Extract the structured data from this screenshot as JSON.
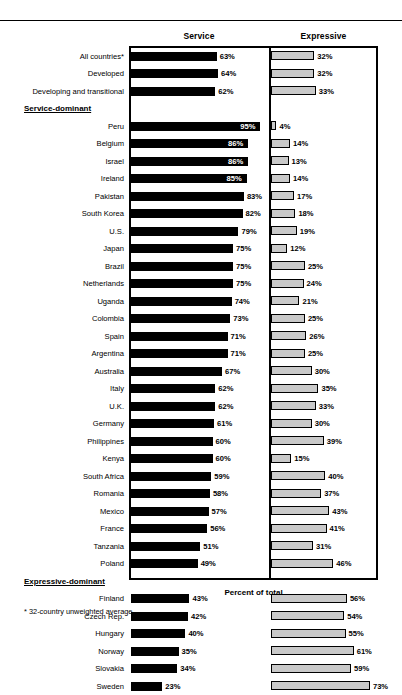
{
  "chart_data": {
    "type": "bar",
    "title": "",
    "xlabel": "Percent of total",
    "ylabel": "",
    "orientation": "horizontal",
    "grid": false,
    "legend_position": "top-column-headers",
    "panels": [
      {
        "name": "Service",
        "header": "Service",
        "xlim": [
          0,
          100
        ],
        "bar_style": "solid-black"
      },
      {
        "name": "Expressive",
        "header": "Expressive",
        "xlim": [
          0,
          75
        ],
        "bar_style": "gray-outlined"
      }
    ],
    "categories": [
      "All countries*",
      "Developed",
      "Developing and transitional",
      "Peru",
      "Belgium",
      "Israel",
      "Ireland",
      "Pakistan",
      "South Korea",
      "U.S.",
      "Japan",
      "Brazil",
      "Netherlands",
      "Uganda",
      "Colombia",
      "Spain",
      "Argentina",
      "Australia",
      "Italy",
      "U.K.",
      "Germany",
      "Philippines",
      "Kenya",
      "South Africa",
      "Romania",
      "Mexico",
      "France",
      "Tanzania",
      "Poland",
      "Finland",
      "Czech Rep.",
      "Hungary",
      "Norway",
      "Slovakia",
      "Sweden"
    ],
    "series": [
      {
        "name": "Service",
        "values": [
          63,
          64,
          62,
          95,
          86,
          86,
          85,
          83,
          82,
          79,
          75,
          75,
          75,
          74,
          73,
          71,
          71,
          67,
          62,
          62,
          61,
          60,
          60,
          59,
          58,
          57,
          56,
          51,
          49,
          43,
          42,
          40,
          35,
          34,
          23
        ]
      },
      {
        "name": "Expressive",
        "values": [
          32,
          32,
          33,
          4,
          14,
          13,
          14,
          17,
          18,
          19,
          12,
          25,
          24,
          21,
          25,
          26,
          25,
          30,
          35,
          33,
          30,
          39,
          15,
          40,
          37,
          43,
          41,
          31,
          46,
          56,
          54,
          55,
          61,
          59,
          73
        ]
      }
    ],
    "section_headers": [
      {
        "label": "Service-dominant",
        "after_category": "Developing and transitional"
      },
      {
        "label": "Expressive-dominant",
        "after_category": "Poland"
      }
    ],
    "footnote": "* 32-country unweighted average."
  },
  "rows": [
    {
      "kind": "data",
      "label": "All countries*",
      "service": 63,
      "expressive": 32
    },
    {
      "kind": "data",
      "label": "Developed",
      "service": 64,
      "expressive": 32
    },
    {
      "kind": "data",
      "label": "Developing and transitional",
      "service": 62,
      "expressive": 33
    },
    {
      "kind": "section",
      "label": "Service-dominant"
    },
    {
      "kind": "data",
      "label": "Peru",
      "service": 95,
      "expressive": 4
    },
    {
      "kind": "data",
      "label": "Belgium",
      "service": 86,
      "expressive": 14
    },
    {
      "kind": "data",
      "label": "Israel",
      "service": 86,
      "expressive": 13
    },
    {
      "kind": "data",
      "label": "Ireland",
      "service": 85,
      "expressive": 14
    },
    {
      "kind": "data",
      "label": "Pakistan",
      "service": 83,
      "expressive": 17
    },
    {
      "kind": "data",
      "label": "South Korea",
      "service": 82,
      "expressive": 18
    },
    {
      "kind": "data",
      "label": "U.S.",
      "service": 79,
      "expressive": 19
    },
    {
      "kind": "data",
      "label": "Japan",
      "service": 75,
      "expressive": 12
    },
    {
      "kind": "data",
      "label": "Brazil",
      "service": 75,
      "expressive": 25
    },
    {
      "kind": "data",
      "label": "Netherlands",
      "service": 75,
      "expressive": 24
    },
    {
      "kind": "data",
      "label": "Uganda",
      "service": 74,
      "expressive": 21
    },
    {
      "kind": "data",
      "label": "Colombia",
      "service": 73,
      "expressive": 25
    },
    {
      "kind": "data",
      "label": "Spain",
      "service": 71,
      "expressive": 26
    },
    {
      "kind": "data",
      "label": "Argentina",
      "service": 71,
      "expressive": 25
    },
    {
      "kind": "data",
      "label": "Australia",
      "service": 67,
      "expressive": 30
    },
    {
      "kind": "data",
      "label": "Italy",
      "service": 62,
      "expressive": 35
    },
    {
      "kind": "data",
      "label": "U.K.",
      "service": 62,
      "expressive": 33
    },
    {
      "kind": "data",
      "label": "Germany",
      "service": 61,
      "expressive": 30
    },
    {
      "kind": "data",
      "label": "Philippines",
      "service": 60,
      "expressive": 39
    },
    {
      "kind": "data",
      "label": "Kenya",
      "service": 60,
      "expressive": 15
    },
    {
      "kind": "data",
      "label": "South Africa",
      "service": 59,
      "expressive": 40
    },
    {
      "kind": "data",
      "label": "Romania",
      "service": 58,
      "expressive": 37
    },
    {
      "kind": "data",
      "label": "Mexico",
      "service": 57,
      "expressive": 43
    },
    {
      "kind": "data",
      "label": "France",
      "service": 56,
      "expressive": 41
    },
    {
      "kind": "data",
      "label": "Tanzania",
      "service": 51,
      "expressive": 31
    },
    {
      "kind": "data",
      "label": "Poland",
      "service": 49,
      "expressive": 46
    },
    {
      "kind": "section",
      "label": "Expressive-dominant"
    },
    {
      "kind": "data",
      "label": "Finland",
      "service": 43,
      "expressive": 56
    },
    {
      "kind": "data",
      "label": "Czech Rep.",
      "service": 42,
      "expressive": 54
    },
    {
      "kind": "data",
      "label": "Hungary",
      "service": 40,
      "expressive": 55
    },
    {
      "kind": "data",
      "label": "Norway",
      "service": 35,
      "expressive": 61
    },
    {
      "kind": "data",
      "label": "Slovakia",
      "service": 34,
      "expressive": 59
    },
    {
      "kind": "data",
      "label": "Sweden",
      "service": 23,
      "expressive": 73
    }
  ],
  "headers": {
    "service": "Service",
    "expressive": "Expressive"
  },
  "axis_title": "Percent of total",
  "footnote": "* 32-country unweighted average.",
  "colors": {
    "service_bar": "#000000",
    "expressive_fill": "#c9c9c9",
    "expressive_stroke": "#000000",
    "frame": "#000000"
  }
}
